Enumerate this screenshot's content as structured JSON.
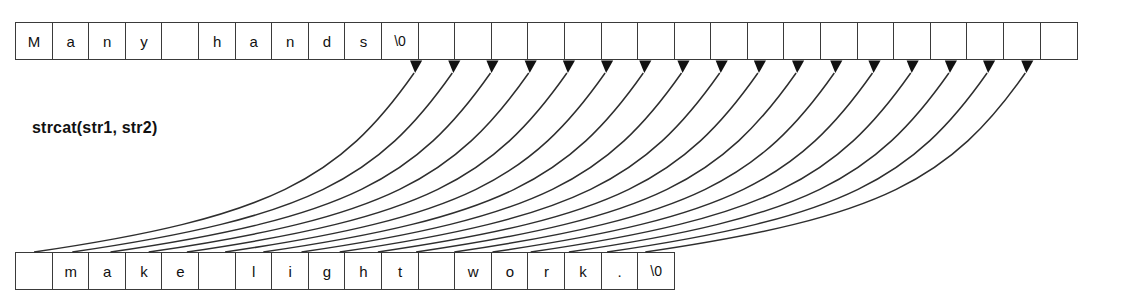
{
  "diagram": {
    "title_label": "strcat(str1, str2)",
    "operation": "strcat",
    "stroke_color": "#2e2e2e",
    "cell_border_color": "#3a3a3a",
    "background_color": "#ffffff",
    "arrow_fill_color": "#111111"
  },
  "top_array": {
    "name": "str1",
    "cell_count": 29,
    "cells": [
      "M",
      "a",
      "n",
      "y",
      "",
      "h",
      "a",
      "n",
      "d",
      "s",
      "\\0",
      "",
      "",
      "",
      "",
      "",
      "",
      "",
      "",
      "",
      "",
      "",
      "",
      "",
      "",
      "",
      "",
      "",
      ""
    ]
  },
  "bottom_array": {
    "name": "str2",
    "cell_count": 17,
    "cells": [
      "",
      "m",
      "a",
      "k",
      "e",
      "",
      "l",
      "i",
      "g",
      "h",
      "t",
      "",
      "w",
      "o",
      "r",
      "k",
      "."
    ],
    "trailing_cells": [
      ". ",
      "\\0"
    ],
    "full_cells": [
      "",
      "m",
      "a",
      "k",
      "e",
      "",
      "l",
      "i",
      "g",
      "h",
      "t",
      "",
      "w",
      "o",
      "r",
      "k",
      ".",
      "\\0"
    ]
  },
  "arrows": {
    "count": 17,
    "source_start_index": 0,
    "target_start_index": 10,
    "style": "curved-arc-with-solid-arrowhead"
  }
}
